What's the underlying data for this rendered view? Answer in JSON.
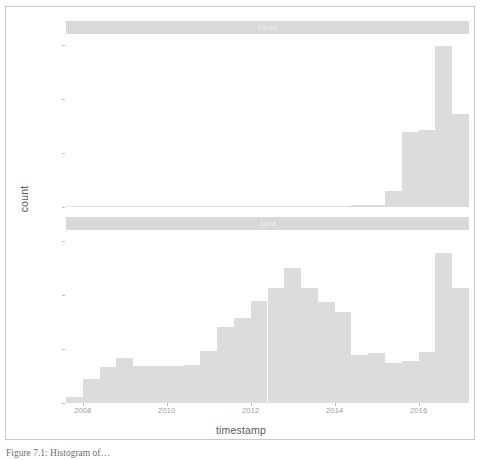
{
  "figure": {
    "caption": "Figure 7.1: Histogram of…"
  },
  "chart_data": {
    "type": "bar",
    "title": "",
    "subtitle": "",
    "xlabel": "timestamp",
    "ylabel": "count",
    "grid": false,
    "legend_position": "none",
    "facet_orientation": "vertical",
    "xlim": [
      2007.6,
      2017.2
    ],
    "ylim": [
      0,
      1600
    ],
    "x_ticks": [
      2008,
      2010,
      2012,
      2014,
      2016
    ],
    "x_tick_labels": [
      "2008",
      "2010",
      "2012",
      "2014",
      "2016"
    ],
    "y_ticks": [
      0,
      500,
      1000,
      1500
    ],
    "y_tick_labels": [
      "0",
      "500",
      "1000",
      "1500"
    ],
    "bin_width": 0.4,
    "facets": [
      {
        "label": "Dead",
        "bin_starts": [
          2007.6,
          2008.0,
          2008.4,
          2008.8,
          2009.2,
          2009.6,
          2010.0,
          2010.4,
          2010.8,
          2011.2,
          2011.6,
          2012.0,
          2012.4,
          2012.8,
          2013.2,
          2013.6,
          2014.0,
          2014.4,
          2014.8,
          2015.2,
          2015.6,
          2016.0,
          2016.4,
          2016.8
        ],
        "values": [
          0,
          0,
          0,
          0,
          0,
          0,
          0,
          0,
          2,
          3,
          4,
          5,
          6,
          7,
          8,
          10,
          12,
          16,
          22,
          150,
          690,
          710,
          1490,
          860
        ]
      },
      {
        "label": "Java",
        "bin_starts": [
          2007.6,
          2008.0,
          2008.4,
          2008.8,
          2009.2,
          2009.6,
          2010.0,
          2010.4,
          2010.8,
          2011.2,
          2011.6,
          2012.0,
          2012.4,
          2012.8,
          2013.2,
          2013.6,
          2014.0,
          2014.4,
          2014.8,
          2015.2,
          2015.6,
          2016.0,
          2016.4,
          2016.8
        ],
        "values": [
          60,
          225,
          330,
          420,
          340,
          345,
          345,
          350,
          480,
          700,
          790,
          940,
          1060,
          1250,
          1060,
          930,
          840,
          440,
          460,
          370,
          390,
          470,
          1390,
          1060
        ]
      }
    ]
  }
}
